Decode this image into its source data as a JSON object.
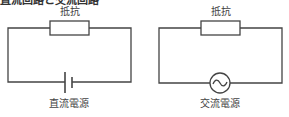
{
  "header": {
    "clipped_title": "直流回路と交流回路"
  },
  "circuits": [
    {
      "id": "dc",
      "resistor_label": "抵抗",
      "source_label": "直流電源",
      "source_type": "battery"
    },
    {
      "id": "ac",
      "resistor_label": "抵抗",
      "source_label": "交流電源",
      "source_type": "ac-source"
    }
  ],
  "colors": {
    "line": "#444444",
    "text": "#444444",
    "background": "#ffffff"
  }
}
